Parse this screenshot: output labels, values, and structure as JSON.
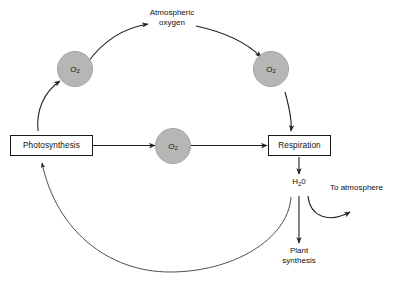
{
  "diagram": {
    "colors": {
      "circle_fill": "#b6b6b6",
      "circle_stroke": "#a3a3a3",
      "line": "#222222",
      "box_stroke": "#1a1a1a",
      "background": "#ffffff",
      "text": "#101010"
    },
    "boxes": [
      {
        "id": "photosynthesis",
        "label": "Photosynthesis"
      },
      {
        "id": "respiration",
        "label": "Respiration"
      }
    ],
    "circles": [
      {
        "id": "o2-upper-left",
        "label": "O",
        "subscript": "2"
      },
      {
        "id": "o2-upper-right",
        "label": "O",
        "subscript": "2"
      },
      {
        "id": "o2-center",
        "label": "O",
        "subscript": "2"
      }
    ],
    "labels": [
      {
        "id": "atmospheric-oxygen",
        "line1": "Atmospheric",
        "line2": "oxygen"
      },
      {
        "id": "water",
        "prefix": "H",
        "subscript": "2",
        "suffix": "0"
      },
      {
        "id": "to-atmosphere",
        "text": "To atmosphere"
      },
      {
        "id": "plant-synthesis",
        "line1": "Plant",
        "line2": "synthesis"
      }
    ],
    "flows": [
      {
        "from": "Photosynthesis",
        "to": "O2 (upper left)",
        "style": "curved-arrow"
      },
      {
        "from": "O2 (upper left)",
        "to": "O2 (upper right)",
        "style": "curved-arrow",
        "label": "Atmospheric oxygen"
      },
      {
        "from": "O2 (upper right)",
        "to": "Respiration",
        "style": "curved-arrow"
      },
      {
        "from": "Photosynthesis",
        "to": "O2 (center)",
        "style": "straight-arrow"
      },
      {
        "from": "O2 (center)",
        "to": "Respiration",
        "style": "straight-arrow"
      },
      {
        "from": "Respiration",
        "to": "H20",
        "style": "straight-arrow"
      },
      {
        "from": "H20",
        "to": "Plant synthesis",
        "style": "straight-arrow"
      },
      {
        "from": "H20",
        "to": "To atmosphere",
        "style": "curved-arrow"
      },
      {
        "from": "H20",
        "to": "Photosynthesis",
        "style": "curved-arrow-bottom"
      }
    ]
  }
}
